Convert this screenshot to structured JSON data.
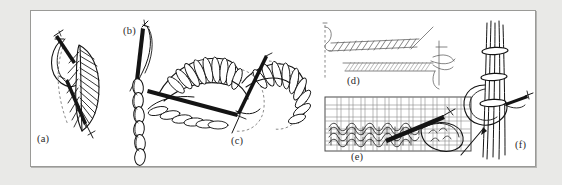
{
  "figure": {
    "background_color": "#e9e9e7",
    "plate_color": "#ffffff",
    "border_color": "#9a9a97",
    "ink_color": "#141414",
    "guide_color": "#6d6d6d",
    "type": "line-art-illustration-plate",
    "panel_count": 6
  },
  "panels": [
    {
      "key": "a",
      "label": "(a)",
      "name": "panel-a-feather-leaf-stitch",
      "description": "Curved needle drawing thread through a leaf-shaped fishbone / closed feather stitch worked over a dashed guideline",
      "elements": [
        "threaded-needle",
        "leaf-outline",
        "slanted-filling-stitches",
        "dashed-guide-line",
        "working-thread-loop"
      ]
    },
    {
      "key": "b",
      "label": "(b)",
      "name": "panel-b-chain-stitch",
      "description": "Vertical column of chain stitch loops with the threaded needle emerging at the top of the chain",
      "elements": [
        "threaded-needle",
        "chain-loop-column",
        "working-thread"
      ]
    },
    {
      "key": "c",
      "label": "(c)",
      "name": "panel-c-long-and-short-fan-stitch",
      "description": "Two fan-shaped petal motifs filled with looped long-and-short satin stitches, a straight needle passing between them and dashed placement circles",
      "elements": [
        "left-fan-motif",
        "right-fan-motif",
        "looped-satin-filling",
        "straight-needle",
        "dashed-guide-arcs"
      ]
    },
    {
      "key": "d",
      "label": "(d)",
      "name": "panel-d-couching-rows",
      "description": "Two horizontal worked bands: an upper open slanted stitch row and a lower dense couched cord row, with the needle entering at the right and a dashed vertical start line at the left",
      "elements": [
        "upper-slanted-stitch-row",
        "lower-couched-cord-row",
        "threaded-needle",
        "dashed-start-line",
        "thread-tail"
      ]
    },
    {
      "key": "e",
      "label": "(e)",
      "name": "panel-e-stitching-on-even-weave-canvas",
      "description": "Rectangular panel of even-weave canvas showing rows of looped stitches worked across the grid with a needle and a large thread loop at the right",
      "elements": [
        "woven-canvas-grid",
        "looped-stitch-rows",
        "needle",
        "large-thread-loop"
      ]
    },
    {
      "key": "f",
      "label": "(f)",
      "name": "panel-f-bundled-thread-wrapping",
      "description": "A vertical bundle of parallel threads bound at three points by wrapped bands, with the needle pulling a looped thread around the bundle",
      "elements": [
        "thread-bundle",
        "wrapped-bands",
        "threaded-needle",
        "thread-loop",
        "loose-thread-end"
      ]
    }
  ]
}
